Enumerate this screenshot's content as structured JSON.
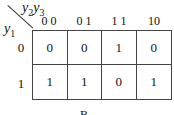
{
  "kmap": {
    "column_var_label": "y2y3",
    "column_var": {
      "a": "y",
      "a_sub": "2",
      "b": "y",
      "b_sub": "3"
    },
    "row_var": {
      "a": "y",
      "a_sub": "1"
    },
    "column_headers": [
      "0 0",
      "0 1",
      "1 1",
      "10"
    ],
    "row_headers": [
      "0",
      "1"
    ],
    "cells": [
      [
        "0",
        "0",
        "1",
        "0"
      ],
      [
        "1",
        "1",
        "0",
        "1"
      ]
    ]
  },
  "caption": "B"
}
